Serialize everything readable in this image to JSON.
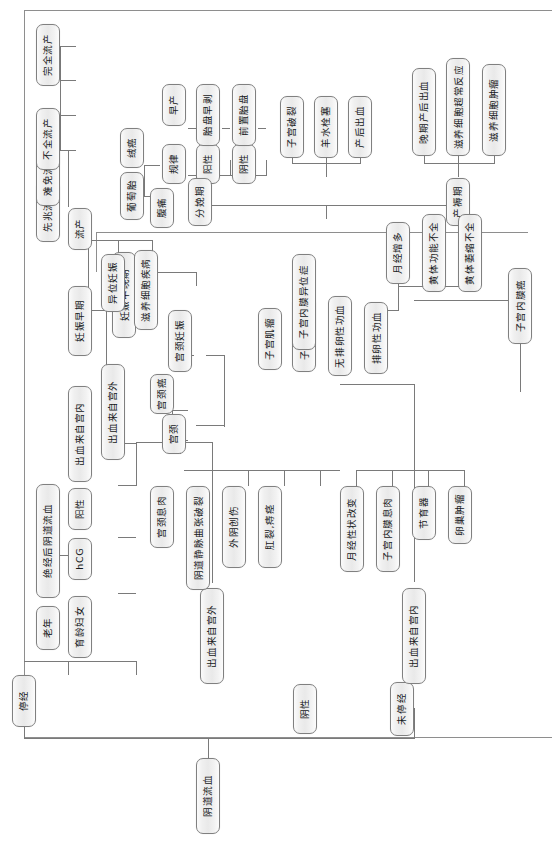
{
  "figure": {
    "title": "阴道流血",
    "orientation": "rotated-90-ccw",
    "type": "decision-tree-flowchart",
    "frame_color": "#8e8e8e",
    "node_border_color": "#808080",
    "node_fill_color": "#ececec",
    "line_color": "#7a7a7a",
    "text_color": "#16181a"
  },
  "nodes": {
    "root": "阴道流血",
    "amenorrhea": "停经",
    "no_amenorrhea": "未停经",
    "negative": "阴性",
    "elderly": "老年",
    "childbearing_women": "育龄妇女",
    "hcg": "hCG",
    "positive_left": "阳性",
    "postmenopausal_bleeding": "绝经后阴道流血",
    "bleed_intrauterine_low": "出血来自宫内",
    "bleed_extrauterine_low": "出血来自宫外",
    "bleed_intrauterine_up": "出血来自宫内",
    "bleed_extrauterine_up": "出血来自宫外",
    "early_pregnancy": "妊娠早期",
    "mid_late_pregnancy": "妊娠中晚期",
    "abortion": "流产",
    "threatened_abortion": "先兆流产",
    "inevitable_abortion": "难免流产",
    "incomplete_abortion": "不全流产",
    "complete_abortion": "完全流产",
    "ectopic_pregnancy": "异位妊娠",
    "trophoblastic_disease": "滋养细胞疾病",
    "hydatidiform_mole": "葡萄胎",
    "choriocarcinoma": "绒癌",
    "abdominal_pain": "腹痛",
    "regular": "规律",
    "positive_a": "阳性",
    "negative_a": "阴性",
    "preterm_birth": "早产",
    "placental_abruption": "胎盘早剥",
    "placenta_previa": "前置胎盘",
    "delivery_stage": "分娩期",
    "uterine_rupture": "子宫破裂",
    "amniotic_embolism": "羊水栓塞",
    "postpartum_hemorrhage": "产后出血",
    "puerperium": "产褥期",
    "late_postpartum_hemorrhage": "晚期产后出血",
    "trophoblast_abnormal_reaction": "滋养细胞超常反应",
    "trophoblastic_tumor": "滋养细胞肿瘤",
    "cervical_pregnancy": "宫颈妊娠",
    "cervix": "宫颈",
    "cervical_cancer": "宫颈癌",
    "cervical_polyp": "宫颈息肉",
    "vaginal_varicose_rupture": "阴道静脉曲张破裂",
    "vulvar_trauma": "外阴创伤",
    "anal_fissure_hemorrhoid": "肛裂,痔痉",
    "uterine_myoma": "子宫肌瘤",
    "adenomyosis": "子宫腺肌症",
    "endometriosis": "子宫内膜异位症",
    "anovulatory_duб": "无排卵性功血",
    "anovulatory_dub": "无排卵性功血",
    "ovulatory_dub": "排卵性功血",
    "menorrhagia": "月经增多",
    "luteal_insufficiency": "黄体功能不全",
    "luteal_atrophy_incomplete": "黄体萎缩不全",
    "menstrual_change": "月经性状改变",
    "endometrial_polyp": "子宫内膜息肉",
    "iud": "节育器",
    "ovarian_tumor": "卵巢肿瘤",
    "endometrial_cancer": "子宫内膜癌"
  }
}
